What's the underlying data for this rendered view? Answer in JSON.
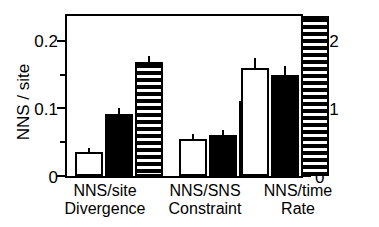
{
  "chart_data": {
    "type": "bar",
    "title": "",
    "xlabel": "",
    "ylabel": "NNS / site",
    "ylabel_right": "NNS / site / 1000 Myr",
    "ylim": [
      0,
      0.2395
    ],
    "yticks_major": [
      0,
      0.1,
      0.2
    ],
    "yticks_major_labels": [
      "0",
      "0.1",
      "0.2"
    ],
    "yticks_minor": [
      0.05,
      0.15
    ],
    "grid": false,
    "legend": "none",
    "categories": [
      {
        "line1": "NNS/site",
        "line2": "Divergence"
      },
      {
        "line1": "NNS/SNS",
        "line2": "Constraint"
      },
      {
        "line1": "NNS/time",
        "line2": "Rate"
      }
    ],
    "series": [
      {
        "name": "open-bar",
        "fill": "white",
        "values": [
          0.035,
          0.055,
          0.16
        ],
        "errors_high": [
          0.042,
          0.062,
          0.174
        ]
      },
      {
        "name": "solid-bar",
        "fill": "black",
        "values": [
          0.092,
          0.06,
          0.15
        ],
        "errors_high": [
          0.101,
          0.068,
          0.163
        ]
      },
      {
        "name": "striped-bar",
        "fill": "horizontal-hatch",
        "values": [
          0.168,
          0.111,
          0.236
        ],
        "errors_high": [
          0.177,
          0.15,
          0.247
        ]
      }
    ],
    "axis_ticks_both_sides": true,
    "colors": {
      "foreground": "#000000",
      "background": "#ffffff"
    }
  },
  "axes": {
    "left": {
      "title": "NNS / site",
      "labels": [
        "0.2",
        "0.1",
        "0"
      ]
    },
    "right": {
      "title": "NNS / site / 1000 Myr",
      "labels": [
        "0.2",
        "0.1",
        "0"
      ]
    }
  },
  "groups": [
    {
      "line1": "NNS/site",
      "line2": "Divergence"
    },
    {
      "line1": "NNS/SNS",
      "line2": "Constraint"
    },
    {
      "line1": "NNS/time",
      "line2": "Rate"
    }
  ]
}
